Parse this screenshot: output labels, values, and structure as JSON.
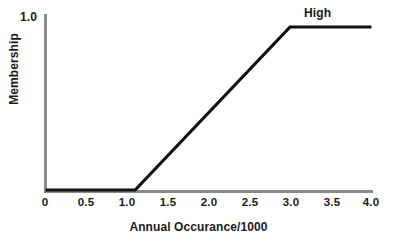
{
  "chart_data": {
    "type": "line",
    "title": "",
    "subtitle": "",
    "xlabel": "Annual Occurance/1000",
    "ylabel": "Membership",
    "xlim": [
      0,
      4.0
    ],
    "ylim": [
      0,
      1.0
    ],
    "grid": false,
    "legend_position": "inline-annotation",
    "x_ticks": [
      "0",
      "0.5",
      "1.0",
      "1.5",
      "2.0",
      "2.5",
      "3.0",
      "3.5",
      "4.0"
    ],
    "x_tick_values": [
      0,
      0.5,
      1.0,
      1.5,
      2.0,
      2.5,
      3.0,
      3.5,
      4.0
    ],
    "y_ticks": [
      "1.0"
    ],
    "y_tick_values": [
      1.0
    ],
    "annotations": [
      {
        "text": "High",
        "x": 3.35,
        "y": 1.0
      }
    ],
    "series": [
      {
        "name": "High",
        "color": "#111111",
        "x": [
          0.0,
          1.1,
          3.0,
          4.0
        ],
        "values": [
          0.0,
          0.0,
          1.0,
          1.0
        ]
      }
    ],
    "axis_color": "#8a8a8a",
    "line_color": "#111111",
    "text_color": "#1a1a1a",
    "background_color": "#ffffff"
  }
}
